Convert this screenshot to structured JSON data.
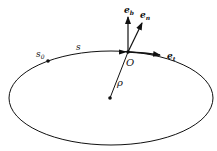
{
  "diagram": {
    "labels": {
      "e_b": "e",
      "e_b_sub": "b",
      "e_n": "e",
      "e_n_sub": "n",
      "e_t": "e",
      "e_t_sub": "t",
      "origin": "O",
      "radius": "ρ",
      "arc": "s",
      "start": "s",
      "start_sub": "0"
    },
    "colors": {
      "stroke": "#111111",
      "background": "#ffffff"
    }
  }
}
